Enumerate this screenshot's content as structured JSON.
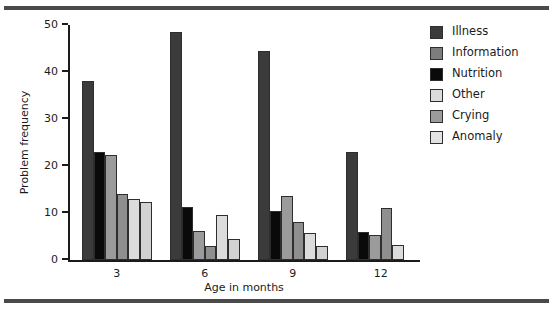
{
  "chart_data": {
    "type": "bar",
    "title": "",
    "xlabel": "Age in months",
    "ylabel": "Problem frequency",
    "categories": [
      "3",
      "6",
      "9",
      "12"
    ],
    "ylim": [
      0,
      50
    ],
    "yticks": [
      0,
      10,
      20,
      30,
      40,
      50
    ],
    "grid": false,
    "legend_position": "right",
    "series": [
      {
        "name": "Illness",
        "color": "#3b3b3b",
        "values": [
          38.0,
          48.5,
          44.5,
          23.0
        ]
      },
      {
        "name": "Information",
        "color": "#7d7d7d",
        "values": [
          23.0,
          11.2,
          10.5,
          6.0
        ]
      },
      {
        "name": "Nutrition",
        "color": "#0a0a0a",
        "values": [
          23.0,
          11.2,
          10.5,
          6.0
        ]
      },
      {
        "name": "Other",
        "color": "#dcdcdc",
        "values": [
          22.3,
          6.2,
          13.6,
          5.3
        ]
      },
      {
        "name": "Crying",
        "color": "#9b9b9b",
        "values": [
          14.0,
          3.0,
          8.0,
          11.0
        ]
      },
      {
        "name": "Anomaly",
        "color": "#e2e2e2",
        "values": [
          13.0,
          9.5,
          5.8,
          0.0
        ]
      }
    ],
    "bars": [
      {
        "group": "3",
        "series": "Illness",
        "value": 38.0,
        "color": "#3b3b3b"
      },
      {
        "group": "3",
        "series": "Nutrition",
        "value": 23.0,
        "color": "#0a0a0a"
      },
      {
        "group": "3",
        "series": "Other",
        "value": 22.3,
        "color": "#9b9b9b"
      },
      {
        "group": "3",
        "series": "Crying",
        "value": 14.0,
        "color": "#8f8f8f"
      },
      {
        "group": "3",
        "series": "Anomaly",
        "value": 13.0,
        "color": "#dcdcdc"
      },
      {
        "group": "3",
        "series": "Information",
        "value": 12.4,
        "color": "#d2d2d2"
      },
      {
        "group": "6",
        "series": "Illness",
        "value": 48.5,
        "color": "#3b3b3b"
      },
      {
        "group": "6",
        "series": "Nutrition",
        "value": 11.2,
        "color": "#0a0a0a"
      },
      {
        "group": "6",
        "series": "Other",
        "value": 6.2,
        "color": "#9b9b9b"
      },
      {
        "group": "6",
        "series": "Crying",
        "value": 3.0,
        "color": "#8f8f8f"
      },
      {
        "group": "6",
        "series": "Anomaly",
        "value": 9.5,
        "color": "#dcdcdc"
      },
      {
        "group": "6",
        "series": "Information",
        "value": 4.5,
        "color": "#d2d2d2"
      },
      {
        "group": "9",
        "series": "Illness",
        "value": 44.5,
        "color": "#3b3b3b"
      },
      {
        "group": "9",
        "series": "Nutrition",
        "value": 10.5,
        "color": "#0a0a0a"
      },
      {
        "group": "9",
        "series": "Other",
        "value": 13.6,
        "color": "#9b9b9b"
      },
      {
        "group": "9",
        "series": "Crying",
        "value": 8.0,
        "color": "#8f8f8f"
      },
      {
        "group": "9",
        "series": "Anomaly",
        "value": 5.8,
        "color": "#dcdcdc"
      },
      {
        "group": "9",
        "series": "Information",
        "value": 3.0,
        "color": "#d2d2d2"
      },
      {
        "group": "12",
        "series": "Illness",
        "value": 23.0,
        "color": "#3b3b3b"
      },
      {
        "group": "12",
        "series": "Nutrition",
        "value": 6.0,
        "color": "#0a0a0a"
      },
      {
        "group": "12",
        "series": "Other",
        "value": 5.3,
        "color": "#9b9b9b"
      },
      {
        "group": "12",
        "series": "Crying",
        "value": 11.0,
        "color": "#8f8f8f"
      },
      {
        "group": "12",
        "series": "Anomaly",
        "value": 3.2,
        "color": "#dcdcdc"
      },
      {
        "group": "12",
        "series": "Information",
        "value": 0.0,
        "color": "#d2d2d2"
      }
    ]
  },
  "axes": {
    "ylabel": "Problem frequency",
    "xlabel": "Age in months",
    "ytick_labels": [
      "0",
      "10",
      "20",
      "30",
      "40",
      "50"
    ],
    "xtick_labels": [
      "3",
      "6",
      "9",
      "12"
    ]
  },
  "legend": {
    "items": [
      {
        "label": "Illness",
        "color": "#3b3b3b"
      },
      {
        "label": "Information",
        "color": "#7d7d7d"
      },
      {
        "label": "Nutrition",
        "color": "#0a0a0a"
      },
      {
        "label": "Other",
        "color": "#dcdcdc"
      },
      {
        "label": "Crying",
        "color": "#9b9b9b"
      },
      {
        "label": "Anomaly",
        "color": "#e2e2e2"
      }
    ]
  }
}
